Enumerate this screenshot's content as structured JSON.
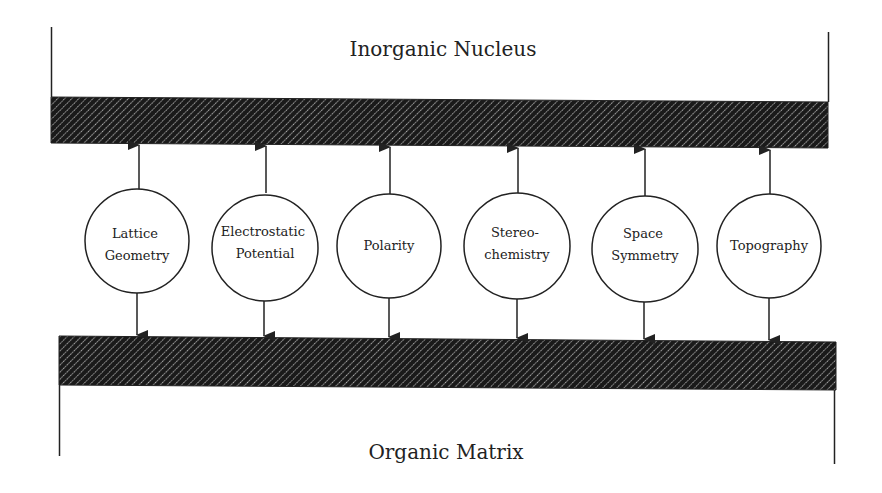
{
  "diagram": {
    "top_label": "Inorganic Nucleus",
    "bottom_label": "Organic Matrix",
    "colors": {
      "stroke": "#222222",
      "hatch_dark": "#1a1a1a",
      "hatch_light": "#ffffff",
      "background": "#ffffff"
    },
    "nodes": [
      {
        "id": "lattice-geometry",
        "lines": [
          "Lattice",
          "Geometry"
        ]
      },
      {
        "id": "electrostatic-potential",
        "lines": [
          "Electrostatic",
          "Potential"
        ]
      },
      {
        "id": "polarity",
        "lines": [
          "Polarity"
        ]
      },
      {
        "id": "stereochemistry",
        "lines": [
          "Stereo-",
          "chemistry"
        ]
      },
      {
        "id": "space-symmetry",
        "lines": [
          "Space",
          "Symmetry"
        ]
      },
      {
        "id": "topography",
        "lines": [
          "Topography"
        ]
      }
    ],
    "edges": [
      {
        "from": "lattice-geometry",
        "to": [
          "inorganic-nucleus",
          "organic-matrix"
        ]
      },
      {
        "from": "electrostatic-potential",
        "to": [
          "inorganic-nucleus",
          "organic-matrix"
        ]
      },
      {
        "from": "polarity",
        "to": [
          "inorganic-nucleus",
          "organic-matrix"
        ]
      },
      {
        "from": "stereochemistry",
        "to": [
          "inorganic-nucleus",
          "organic-matrix"
        ]
      },
      {
        "from": "space-symmetry",
        "to": [
          "inorganic-nucleus",
          "organic-matrix"
        ]
      },
      {
        "from": "topography",
        "to": [
          "inorganic-nucleus",
          "organic-matrix"
        ]
      }
    ]
  }
}
